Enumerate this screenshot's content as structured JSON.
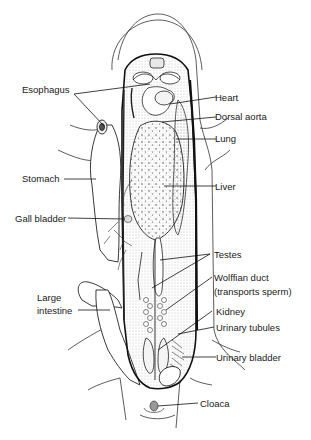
{
  "figure": {
    "labels": {
      "esophagus": "Esophagus",
      "heart": "Heart",
      "dorsal_aorta": "Dorsal aorta",
      "lung": "Lung",
      "stomach": "Stomach",
      "liver": "Liver",
      "gall_bladder": "Gall bladder",
      "testes": "Testes",
      "wolffian_duct_1": "Wolffian duct",
      "wolffian_duct_2": "(transports sperm)",
      "large_intestine_1": "Large",
      "large_intestine_2": "intestine",
      "kidney": "Kidney",
      "urinary_tubules": "Urinary tubules",
      "urinary_bladder": "Urinary bladder",
      "cloaca": "Cloaca"
    },
    "colors": {
      "ink": "#1a1a1a",
      "background": "#ffffff",
      "stipple": "#555555"
    }
  }
}
